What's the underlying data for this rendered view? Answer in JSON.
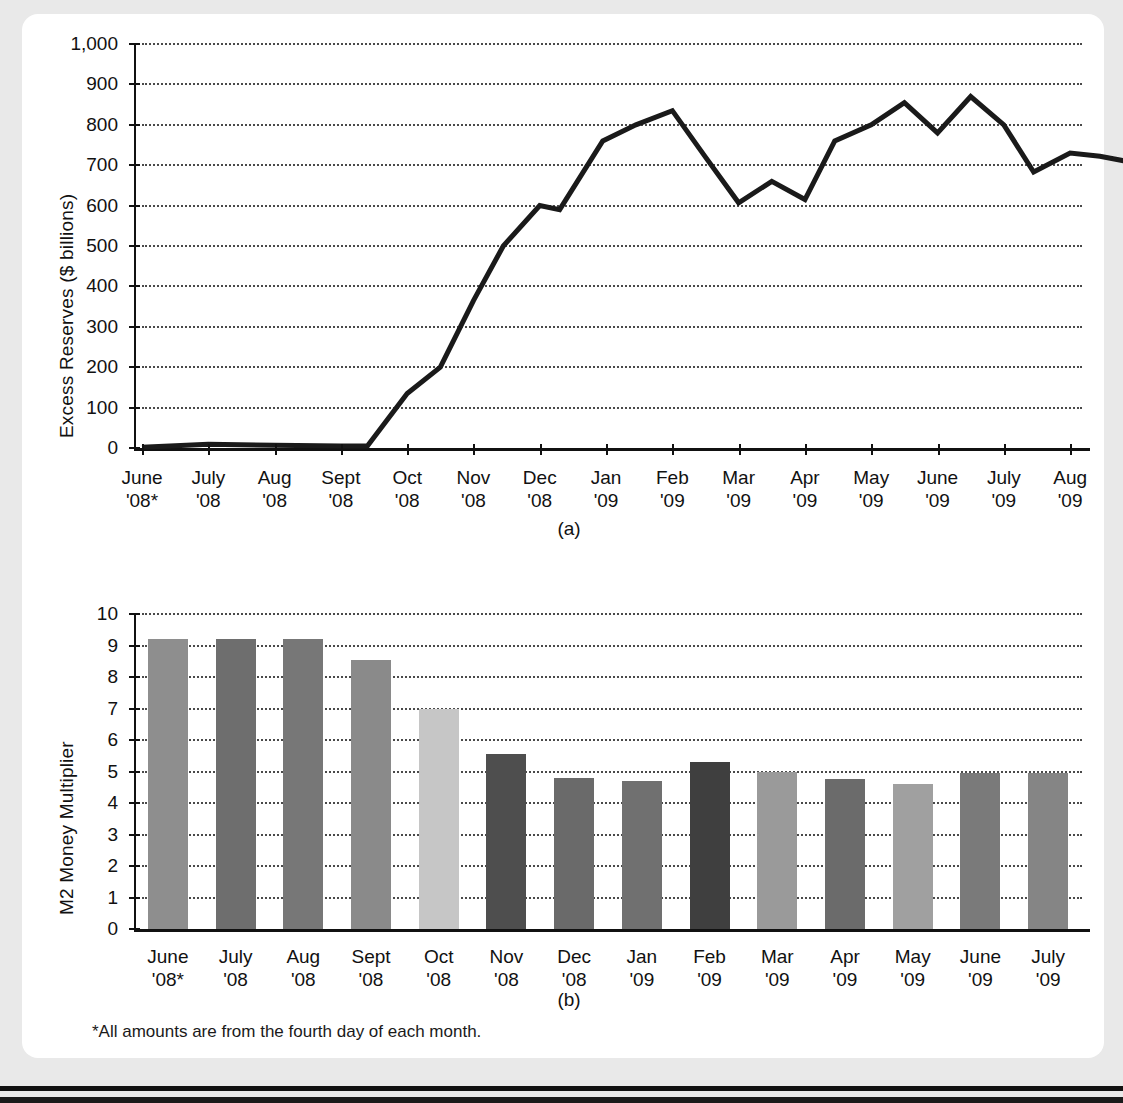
{
  "figure": {
    "ghost_caption": "",
    "footnote": "*All amounts are from the fourth day of each month.",
    "panel_a_letter": "(a)",
    "panel_b_letter": "(b)",
    "card_color": "#ffffff",
    "page_color": "#e9e9e9",
    "ink_color": "#111111"
  },
  "chart_data": [
    {
      "type": "line",
      "panel": "(a)",
      "title": "",
      "xlabel": "",
      "ylabel": "Excess Reserves ($ billions)",
      "ylim": [
        0,
        1000
      ],
      "ytick_values": [
        0,
        100,
        200,
        300,
        400,
        500,
        600,
        700,
        800,
        900,
        1000
      ],
      "ytick_labels": [
        "0",
        "100",
        "200",
        "300",
        "400",
        "500",
        "600",
        "700",
        "800",
        "900",
        "1,000"
      ],
      "grid": true,
      "legend": "none",
      "categories": [
        "June\n'08*",
        "July\n'08",
        "Aug\n'08",
        "Sept\n'08",
        "Oct\n'08",
        "Nov\n'08",
        "Dec\n'08",
        "Jan\n'09",
        "Feb\n'09",
        "Mar\n'09",
        "Apr\n'09",
        "May\n'09",
        "June\n'09",
        "July\n'09",
        "Aug\n'09"
      ],
      "category_lines": [
        [
          "June",
          "'08*"
        ],
        [
          "July",
          "'08"
        ],
        [
          "Aug",
          "'08"
        ],
        [
          "Sept",
          "'08"
        ],
        [
          "Oct",
          "'08"
        ],
        [
          "Nov",
          "'08"
        ],
        [
          "Dec",
          "'08"
        ],
        [
          "Jan",
          "'09"
        ],
        [
          "Feb",
          "'09"
        ],
        [
          "Mar",
          "'09"
        ],
        [
          "Apr",
          "'09"
        ],
        [
          "May",
          "'09"
        ],
        [
          "June",
          "'09"
        ],
        [
          "July",
          "'09"
        ],
        [
          "Aug",
          "'09"
        ]
      ],
      "x": [
        0,
        0.5,
        1,
        1.5,
        2,
        2.5,
        3,
        3.5,
        4,
        4.5,
        5,
        5.5,
        6,
        6.5,
        7,
        7.5,
        8,
        8.5,
        9,
        9.5,
        10,
        10.5,
        11,
        11.5,
        12,
        12.5,
        13,
        13.5,
        14
      ],
      "values": [
        2,
        5,
        8,
        7,
        6,
        6,
        5,
        5,
        5,
        135,
        200,
        290,
        365,
        500,
        600,
        590,
        760,
        800,
        835,
        725,
        607,
        660,
        615,
        760,
        800,
        855,
        780,
        870,
        840,
        800,
        683,
        710,
        730,
        722,
        705,
        780
      ],
      "series": [
        {
          "name": "Excess Reserves",
          "points": [
            {
              "x": 0.0,
              "y": 2
            },
            {
              "x": 1.0,
              "y": 9
            },
            {
              "x": 2.0,
              "y": 7
            },
            {
              "x": 3.0,
              "y": 5
            },
            {
              "x": 3.4,
              "y": 5
            },
            {
              "x": 4.0,
              "y": 135
            },
            {
              "x": 4.5,
              "y": 200
            },
            {
              "x": 5.0,
              "y": 365
            },
            {
              "x": 5.45,
              "y": 500
            },
            {
              "x": 6.0,
              "y": 600
            },
            {
              "x": 6.3,
              "y": 590
            },
            {
              "x": 6.95,
              "y": 760
            },
            {
              "x": 7.45,
              "y": 800
            },
            {
              "x": 8.0,
              "y": 835
            },
            {
              "x": 8.5,
              "y": 720
            },
            {
              "x": 9.0,
              "y": 607
            },
            {
              "x": 9.5,
              "y": 660
            },
            {
              "x": 10.0,
              "y": 615
            },
            {
              "x": 10.45,
              "y": 760
            },
            {
              "x": 11.0,
              "y": 800
            },
            {
              "x": 11.5,
              "y": 855
            },
            {
              "x": 12.0,
              "y": 780
            },
            {
              "x": 12.5,
              "y": 870
            },
            {
              "x": 13.0,
              "y": 800
            },
            {
              "x": 13.45,
              "y": 683
            },
            {
              "x": 14.0,
              "y": 730
            },
            {
              "x": 14.45,
              "y": 722
            },
            {
              "x": 15.0,
              "y": 705
            },
            {
              "x": 15.45,
              "y": 782
            }
          ]
        }
      ],
      "line_color": "#1a1a1a",
      "line_width": 5
    },
    {
      "type": "bar",
      "panel": "(b)",
      "title": "",
      "xlabel": "",
      "ylabel": "M2 Money Multiplier",
      "ylim": [
        0,
        10
      ],
      "ytick_values": [
        0,
        1,
        2,
        3,
        4,
        5,
        6,
        7,
        8,
        9,
        10
      ],
      "ytick_labels": [
        "0",
        "1",
        "2",
        "3",
        "4",
        "5",
        "6",
        "7",
        "8",
        "9",
        "10"
      ],
      "grid": true,
      "legend": "none",
      "categories": [
        "June '08*",
        "July '08",
        "Aug '08",
        "Sept '08",
        "Oct '08",
        "Nov '08",
        "Dec '08",
        "Jan '09",
        "Feb '09",
        "Mar '09",
        "Apr '09",
        "May '09",
        "June '09",
        "July '09"
      ],
      "category_lines": [
        [
          "June",
          "'08*"
        ],
        [
          "July",
          "'08"
        ],
        [
          "Aug",
          "'08"
        ],
        [
          "Sept",
          "'08"
        ],
        [
          "Oct",
          "'08"
        ],
        [
          "Nov",
          "'08"
        ],
        [
          "Dec",
          "'08"
        ],
        [
          "Jan",
          "'09"
        ],
        [
          "Feb",
          "'09"
        ],
        [
          "Mar",
          "'09"
        ],
        [
          "Apr",
          "'09"
        ],
        [
          "May",
          "'09"
        ],
        [
          "June",
          "'09"
        ],
        [
          "July",
          "'09"
        ]
      ],
      "values": [
        9.2,
        9.2,
        9.2,
        8.55,
        7.0,
        5.55,
        4.8,
        4.7,
        5.3,
        5.0,
        4.75,
        4.6,
        4.95,
        4.95
      ],
      "bar_colors": [
        "#8e8e8e",
        "#6e6e6e",
        "#777777",
        "#8a8a8a",
        "#c6c6c6",
        "#4e4e4e",
        "#6a6a6a",
        "#707070",
        "#3f3f3f",
        "#9a9a9a",
        "#6b6b6b",
        "#a0a0a0",
        "#7a7a7a",
        "#858585"
      ]
    }
  ]
}
